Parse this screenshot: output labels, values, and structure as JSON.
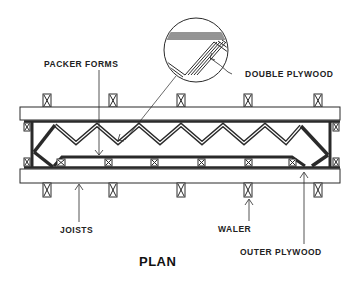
{
  "diagram": {
    "title": "PLAN",
    "labels": {
      "packer_forms": "PACKER FORMS",
      "double_plywood": "DOUBLE PLYWOOD",
      "joists": "JOISTS",
      "waler": "WALER",
      "outer_plywood": "OUTER PLYWOOD"
    },
    "components": [
      "joists",
      "walers",
      "packer forms (zigzag)",
      "double plywood (detail)",
      "outer plywood"
    ],
    "colors": {
      "ink": "#2a2a2a",
      "background": "#ffffff"
    }
  }
}
